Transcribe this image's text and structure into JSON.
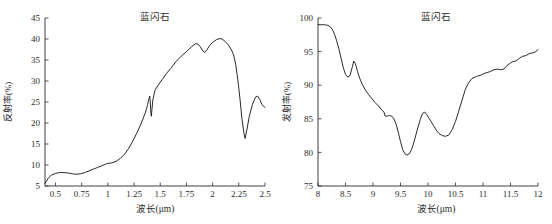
{
  "figure": {
    "background": "#ffffff",
    "curve_color": "#1e1e1e",
    "axis_color": "#2b2b2b"
  },
  "chart_data": [
    {
      "type": "line",
      "panel": "left",
      "title": "蓝闪石",
      "xlabel": "波长(μm)",
      "ylabel": "反射率(%)",
      "xlim": [
        0.4,
        2.5
      ],
      "ylim": [
        5,
        45
      ],
      "grid": false,
      "legend": null,
      "xticks": [
        0.5,
        0.75,
        1,
        1.25,
        1.5,
        1.75,
        2,
        2.25,
        2.5
      ],
      "xticklabels": [
        "0.5",
        "0.75",
        "1",
        "1.25",
        "1.5",
        "1.75",
        "2",
        "2.25",
        "2.5"
      ],
      "yticks": [
        5,
        10,
        15,
        20,
        25,
        30,
        35,
        40,
        45
      ],
      "yticklabels": [
        "5",
        "10",
        "15",
        "20",
        "25",
        "30",
        "35",
        "40",
        "45"
      ],
      "series": [
        {
          "name": "蓝闪石反射率",
          "x": [
            0.4,
            0.43,
            0.46,
            0.5,
            0.54,
            0.58,
            0.62,
            0.66,
            0.7,
            0.74,
            0.78,
            0.82,
            0.86,
            0.9,
            0.94,
            0.98,
            1.0,
            1.04,
            1.08,
            1.12,
            1.16,
            1.2,
            1.24,
            1.28,
            1.32,
            1.36,
            1.38,
            1.39,
            1.4,
            1.405,
            1.41,
            1.415,
            1.42,
            1.43,
            1.45,
            1.48,
            1.52,
            1.56,
            1.6,
            1.65,
            1.7,
            1.75,
            1.8,
            1.84,
            1.86,
            1.88,
            1.9,
            1.92,
            1.94,
            1.97,
            2.0,
            2.04,
            2.07,
            2.09,
            2.12,
            2.15,
            2.18,
            2.2,
            2.22,
            2.24,
            2.26,
            2.28,
            2.3,
            2.31,
            2.33,
            2.35,
            2.38,
            2.41,
            2.43,
            2.45,
            2.47,
            2.5
          ],
          "y": [
            5.6,
            6.8,
            7.6,
            8.0,
            8.2,
            8.2,
            8.1,
            7.9,
            7.8,
            7.9,
            8.2,
            8.6,
            9.0,
            9.4,
            9.8,
            10.2,
            10.4,
            10.5,
            10.9,
            11.6,
            12.6,
            14.0,
            15.8,
            17.8,
            20.0,
            22.6,
            24.4,
            25.6,
            26.4,
            25.0,
            22.6,
            21.6,
            23.0,
            25.6,
            27.8,
            29.0,
            30.4,
            31.8,
            33.0,
            34.6,
            35.9,
            37.0,
            38.2,
            38.9,
            38.8,
            38.2,
            37.4,
            36.8,
            37.2,
            38.4,
            39.2,
            39.9,
            40.1,
            40.0,
            39.4,
            38.6,
            37.4,
            36.2,
            34.0,
            30.4,
            26.0,
            21.0,
            17.4,
            16.3,
            18.8,
            21.6,
            24.4,
            26.2,
            26.4,
            25.6,
            24.4,
            23.7
          ]
        }
      ]
    },
    {
      "type": "line",
      "panel": "right",
      "title": "蓝闪石",
      "xlabel": "波长(μm)",
      "ylabel": "发射率(%)",
      "xlim": [
        8,
        12
      ],
      "ylim": [
        75,
        100
      ],
      "grid": false,
      "legend": null,
      "xticks": [
        8,
        8.5,
        9,
        9.5,
        10,
        10.5,
        11,
        11.5,
        12
      ],
      "xticklabels": [
        "8",
        "8.5",
        "9",
        "9.5",
        "10",
        "10.5",
        "11",
        "11.5",
        "12"
      ],
      "yticks": [
        75,
        80,
        85,
        90,
        95,
        100
      ],
      "yticklabels": [
        "75",
        "80",
        "85",
        "90",
        "95",
        "100"
      ],
      "series": [
        {
          "name": "蓝闪石发射率",
          "x": [
            8.0,
            8.06,
            8.12,
            8.18,
            8.22,
            8.26,
            8.3,
            8.34,
            8.38,
            8.42,
            8.46,
            8.5,
            8.54,
            8.58,
            8.62,
            8.65,
            8.68,
            8.72,
            8.76,
            8.8,
            8.86,
            8.92,
            8.98,
            9.04,
            9.1,
            9.16,
            9.2,
            9.22,
            9.26,
            9.3,
            9.34,
            9.38,
            9.42,
            9.46,
            9.5,
            9.54,
            9.58,
            9.62,
            9.66,
            9.7,
            9.74,
            9.78,
            9.82,
            9.86,
            9.9,
            9.94,
            9.98,
            10.04,
            10.1,
            10.16,
            10.2,
            10.26,
            10.32,
            10.38,
            10.44,
            10.5,
            10.56,
            10.62,
            10.68,
            10.74,
            10.8,
            10.88,
            10.96,
            11.04,
            11.12,
            11.2,
            11.26,
            11.32,
            11.38,
            11.42,
            11.48,
            11.54,
            11.6,
            11.66,
            11.72,
            11.78,
            11.84,
            11.9,
            11.96,
            12.0
          ],
          "y": [
            99.0,
            99.0,
            99.0,
            98.9,
            98.7,
            98.3,
            97.6,
            96.6,
            95.4,
            94.0,
            92.6,
            91.6,
            91.2,
            91.4,
            92.6,
            93.6,
            93.2,
            92.0,
            91.0,
            90.2,
            89.3,
            88.6,
            88.0,
            87.4,
            86.9,
            86.3,
            86.0,
            85.4,
            85.4,
            85.5,
            85.4,
            85.0,
            84.2,
            83.0,
            81.6,
            80.4,
            79.8,
            79.6,
            79.8,
            80.4,
            81.4,
            82.6,
            83.8,
            84.9,
            85.8,
            86.0,
            85.6,
            84.8,
            84.0,
            83.2,
            82.8,
            82.5,
            82.4,
            82.6,
            83.4,
            84.6,
            86.2,
            87.8,
            89.4,
            90.4,
            91.0,
            91.3,
            91.5,
            91.8,
            92.0,
            92.3,
            92.4,
            92.3,
            92.4,
            92.8,
            93.2,
            93.5,
            93.6,
            94.0,
            94.3,
            94.4,
            94.7,
            94.8,
            95.0,
            95.3
          ]
        }
      ]
    }
  ]
}
